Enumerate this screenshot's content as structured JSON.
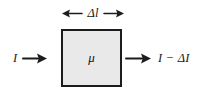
{
  "figure": {
    "name": "beam-attenuation-diagram",
    "background_color": "#ffffff",
    "stroke_color": "#1c1c1c"
  },
  "thickness": {
    "left_arrow_icon": "arrow-left-icon",
    "label": "Δl",
    "right_arrow_icon": "arrow-right-icon"
  },
  "medium": {
    "symbol": "μ",
    "fill_color": "#e9e9e9",
    "border_color": "#1c1c1c"
  },
  "incident": {
    "label": "I",
    "arrow_icon": "arrow-right-icon"
  },
  "transmitted": {
    "arrow_icon": "arrow-right-icon",
    "label": "I − ΔI"
  }
}
